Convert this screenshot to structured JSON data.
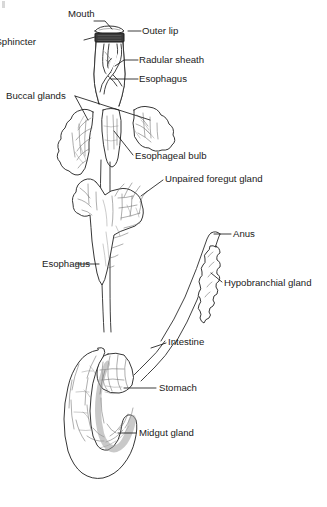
{
  "figure": {
    "type": "anatomical-diagram",
    "style": "black-and-white line drawing with stippled/mottled shading",
    "background_color": "#ffffff",
    "line_color": "#2b2b2b",
    "text_color": "#1a1a1a",
    "width": 327,
    "height": 507
  },
  "labels": {
    "mouth": "Mouth",
    "outer_lip": "Outer lip",
    "sphincter": "Sphincter",
    "radular_sheath": "Radular sheath",
    "esophagus_top": "Esophagus",
    "buccal_glands": "Buccal glands",
    "esophageal_bulb": "Esophageal bulb",
    "unpaired_foregut_gland": "Unpaired foregut gland",
    "anus": "Anus",
    "esophagus_mid": "Esophagus",
    "hypobranchial_gland": "Hypobranchial gland",
    "intestine": "Intestine",
    "stomach": "Stomach",
    "midgut_gland": "Midgut gland"
  },
  "structures": [
    {
      "name": "outer-lip",
      "label": "Outer lip",
      "region": "top"
    },
    {
      "name": "mouth",
      "label": "Mouth",
      "region": "top"
    },
    {
      "name": "sphincter",
      "label": "Sphincter",
      "region": "top"
    },
    {
      "name": "proboscis",
      "label": "",
      "region": "top"
    },
    {
      "name": "radular-sheath",
      "label": "Radular sheath",
      "region": "upper"
    },
    {
      "name": "esophagus",
      "label": "Esophagus",
      "region": "upper"
    },
    {
      "name": "buccal-gland-left",
      "label": "Buccal glands",
      "region": "upper"
    },
    {
      "name": "buccal-gland-right",
      "label": "Buccal glands",
      "region": "upper"
    },
    {
      "name": "esophageal-bulb",
      "label": "Esophageal bulb",
      "region": "upper"
    },
    {
      "name": "unpaired-foregut-gland",
      "label": "Unpaired foregut gland",
      "region": "middle"
    },
    {
      "name": "anus",
      "label": "Anus",
      "region": "middle"
    },
    {
      "name": "hypobranchial-gland",
      "label": "Hypobranchial gland",
      "region": "middle"
    },
    {
      "name": "rectum",
      "label": "",
      "region": "middle"
    },
    {
      "name": "intestine",
      "label": "Intestine",
      "region": "lower"
    },
    {
      "name": "stomach",
      "label": "Stomach",
      "region": "lower"
    },
    {
      "name": "midgut-gland",
      "label": "Midgut gland",
      "region": "lower"
    }
  ]
}
